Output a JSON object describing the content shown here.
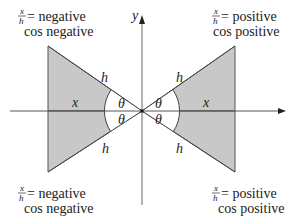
{
  "diagram": {
    "title": "",
    "axes": {
      "x_label": "",
      "y_label": "y"
    },
    "triangles": [
      {
        "name": "left-triangle",
        "side_label": "x",
        "hyp_label": "h",
        "angle_label": "θ"
      },
      {
        "name": "right-triangle",
        "side_label": "x",
        "hyp_label": "h",
        "angle_label": "θ"
      }
    ],
    "quadrant_labels": {
      "top_left": {
        "frac_num": "x",
        "frac_den": "h",
        "eq": "= negative",
        "line2": "cos negative"
      },
      "top_right": {
        "frac_num": "x",
        "frac_den": "h",
        "eq": "= positive",
        "line2": "cos positive"
      },
      "bottom_left": {
        "frac_num": "x",
        "frac_den": "h",
        "eq": "= negative",
        "line2": "cos negative"
      },
      "bottom_right": {
        "frac_num": "x",
        "frac_den": "h",
        "eq": "= positive",
        "line2": "cos positive"
      }
    },
    "labels": {
      "x_left": "x",
      "x_right": "x",
      "h_tl": "h",
      "h_tr": "h",
      "h_bl": "h",
      "h_br": "h",
      "theta_tl": "θ",
      "theta_bl": "θ",
      "theta_tr": "θ",
      "theta_br": "θ"
    },
    "colors": {
      "fill": "#c8c8c8",
      "stroke": "#444444",
      "axis": "#666666",
      "text": "#222222"
    }
  }
}
